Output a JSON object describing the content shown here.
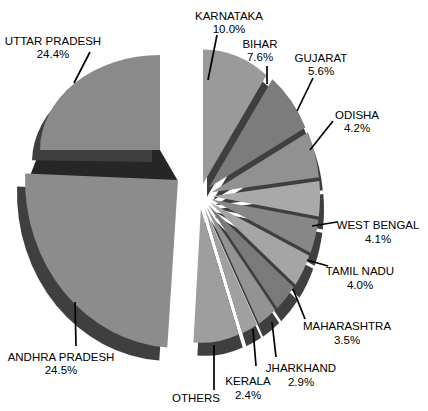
{
  "figure": {
    "kind": "3d exploded pie chart",
    "background": "#ffffff"
  },
  "chart_data": {
    "type": "pie",
    "style": "3d-exploded-grayscale",
    "title": "",
    "unit": "%",
    "legend_position": "callout-labels",
    "slices": [
      {
        "id": "karnataka",
        "label": "KARNATAKA",
        "value": 10.0,
        "pct_label": "10.0%",
        "color": "#9a9a9a"
      },
      {
        "id": "bihar",
        "label": "BIHAR",
        "value": 7.6,
        "pct_label": "7.6%",
        "color": "#7c7c7c"
      },
      {
        "id": "gujarat",
        "label": "GUJARAT",
        "value": 5.6,
        "pct_label": "5.6%",
        "color": "#919191"
      },
      {
        "id": "odisha",
        "label": "ODISHA",
        "value": 4.2,
        "pct_label": "4.2%",
        "color": "#a9a9a9"
      },
      {
        "id": "west-bengal",
        "label": "WEST BENGAL",
        "value": 4.1,
        "pct_label": "4.1%",
        "color": "#878787"
      },
      {
        "id": "tamil-nadu",
        "label": "TAMIL NADU",
        "value": 4.0,
        "pct_label": "4.0%",
        "color": "#a5a5a5"
      },
      {
        "id": "maharashtra",
        "label": "MAHARASHTRA",
        "value": 3.5,
        "pct_label": "3.5%",
        "color": "#7a7a7a"
      },
      {
        "id": "jharkhand",
        "label": "JHARKHAND",
        "value": 2.9,
        "pct_label": "2.9%",
        "color": "#939393"
      },
      {
        "id": "kerala",
        "label": "KERALA",
        "value": 2.4,
        "pct_label": "2.4%",
        "color": "#a0a0a0"
      },
      {
        "id": "others",
        "label": "OTHERS",
        "value": 6.8,
        "pct_label": "",
        "color": "#9e9e9e"
      },
      {
        "id": "andhra-pradesh",
        "label": "ANDHRA PRADESH",
        "value": 24.5,
        "pct_label": "24.5%",
        "color": "#8c8c8c"
      },
      {
        "id": "uttar-pradesh",
        "label": "UTTAR PRADESH",
        "value": 24.4,
        "pct_label": "24.4%",
        "color": "#8a8a8a"
      }
    ],
    "colors": {
      "side_face": "#3f3f3f",
      "separator_band": "#262626",
      "leader_line": "#000000",
      "label_text": "#000000"
    }
  }
}
